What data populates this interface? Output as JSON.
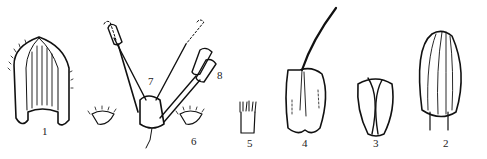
{
  "figure": {
    "type": "botanical line drawing",
    "background": "#ffffff",
    "ink_color": "#111111",
    "parts": [
      {
        "id": "part-1",
        "label": "1",
        "x": 42,
        "y": 136
      },
      {
        "id": "part-2",
        "label": "2",
        "x": 443,
        "y": 146
      },
      {
        "id": "part-3",
        "label": "3",
        "x": 373,
        "y": 146
      },
      {
        "id": "part-4",
        "label": "4",
        "x": 302,
        "y": 146
      },
      {
        "id": "part-5",
        "label": "5",
        "x": 247,
        "y": 146
      },
      {
        "id": "part-6",
        "label": "6",
        "x": 191,
        "y": 142
      },
      {
        "id": "part-7",
        "label": "7",
        "x": 148,
        "y": 80
      },
      {
        "id": "part-8",
        "label": "8",
        "x": 217,
        "y": 74
      }
    ]
  }
}
